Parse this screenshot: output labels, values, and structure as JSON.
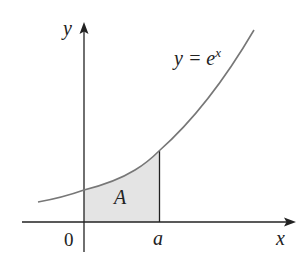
{
  "figure": {
    "type": "diagram",
    "labels": {
      "y_axis": "y",
      "x_axis": "x",
      "curve_lhs": "y = e",
      "curve_exponent": "x",
      "region": "A",
      "origin": "0",
      "upper_bound": "a"
    },
    "colors": {
      "axis": "#222222",
      "curve": "#777777",
      "shade": "#e4e4e4",
      "text": "#222222"
    },
    "geometry": {
      "origin_px": [
        84,
        222
      ],
      "a_px": 159,
      "curve_function": "exp",
      "shaded_interval": [
        0,
        "a"
      ]
    }
  }
}
